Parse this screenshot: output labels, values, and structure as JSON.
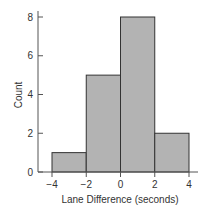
{
  "chart_data": {
    "type": "bar",
    "subtype": "histogram",
    "title": "",
    "xlabel": "Lane Difference (seconds)",
    "ylabel": "Count",
    "bins": [
      {
        "from": -4,
        "to": -2,
        "count": 1
      },
      {
        "from": -2,
        "to": 0,
        "count": 5
      },
      {
        "from": 0,
        "to": 2,
        "count": 8
      },
      {
        "from": 2,
        "to": 4,
        "count": 2
      }
    ],
    "categories": [
      "-4 to -2",
      "-2 to 0",
      "0 to 2",
      "2 to 4"
    ],
    "values": [
      1,
      5,
      8,
      2
    ],
    "xlim": [
      -4,
      4
    ],
    "ylim": [
      0,
      8
    ],
    "x_ticks": [
      "−4",
      "−2",
      "0",
      "2",
      "4"
    ],
    "y_ticks": [
      "0",
      "2",
      "4",
      "6",
      "8"
    ],
    "grid": false,
    "legend": null,
    "colors": {
      "bar_fill": "#b3b3b3",
      "bar_stroke": "#333333",
      "axis": "#555555"
    }
  }
}
